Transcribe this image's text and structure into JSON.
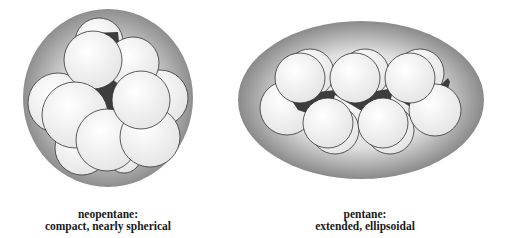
{
  "figure": {
    "panels": [
      {
        "id": "neopentane",
        "name": "neopentane",
        "description": "compact, nearly spherical",
        "title_line": "neopentane:",
        "desc_line": "compact, nearly spherical",
        "envelope_shape": "sphere"
      },
      {
        "id": "pentane",
        "name": "pentane",
        "description": "extended, ellipsoidal",
        "title_line": "pentane:",
        "desc_line": "extended, ellipsoidal",
        "envelope_shape": "ellipsoid"
      }
    ],
    "colors": {
      "envelope_dark": "#8f8f8f",
      "envelope_light": "#f2f2f2",
      "atom_fill": "#f4f4f4",
      "atom_stroke": "#333333",
      "carbon_dark": "#3d3d3d"
    }
  }
}
